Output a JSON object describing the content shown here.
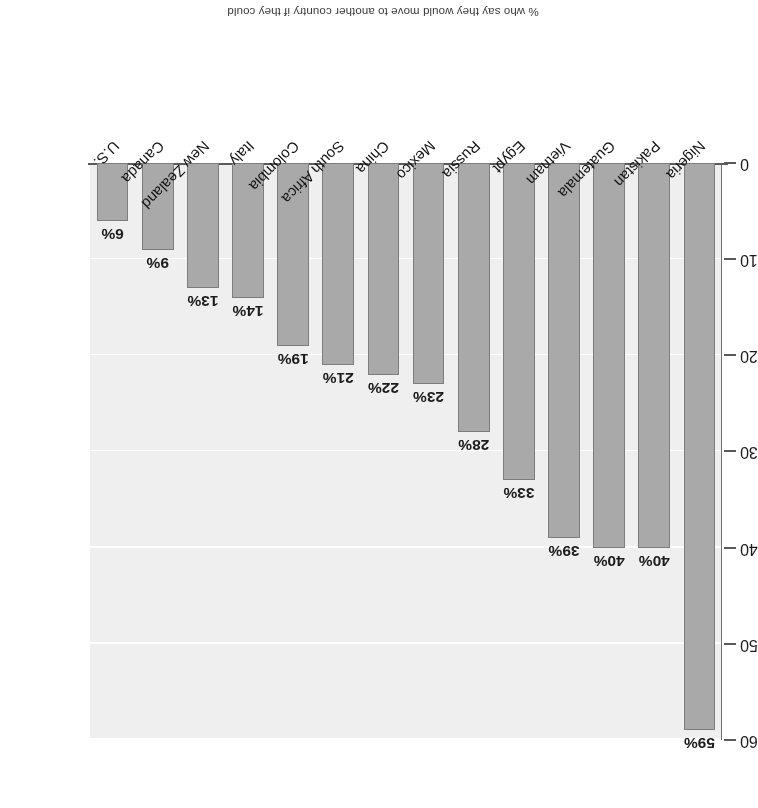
{
  "chart_data": {
    "type": "bar",
    "title": "% who say they would move to another country if they could",
    "subtitle": "",
    "xlabel": "",
    "ylabel": "",
    "ylim": [
      0,
      60
    ],
    "yticks": [
      "0",
      "10",
      "20",
      "30",
      "40",
      "50",
      "60"
    ],
    "grid": true,
    "legend": false,
    "orientation": "rotated-180",
    "bar_color": "#a9a9a9",
    "bar_border_color": "#7d7d7d",
    "plot_background": "#efefef",
    "gridline_color": "#ffffff",
    "axis_color": "#5a5a5a",
    "categories": [
      "Nigeria",
      "Pakistan",
      "Guatemala",
      "Vietnam",
      "Egypt",
      "Russia",
      "Mexico",
      "China",
      "South Africa",
      "Colombia",
      "Italy",
      "New Zealand",
      "Canada",
      "U.S."
    ],
    "values": [
      59,
      40,
      40,
      39,
      33,
      28,
      23,
      22,
      21,
      19,
      14,
      13,
      9,
      6
    ],
    "data_labels": [
      "59%",
      "40%",
      "40%",
      "39%",
      "33%",
      "28%",
      "23%",
      "22%",
      "21%",
      "19%",
      "14%",
      "13%",
      "9%",
      "6%"
    ]
  }
}
